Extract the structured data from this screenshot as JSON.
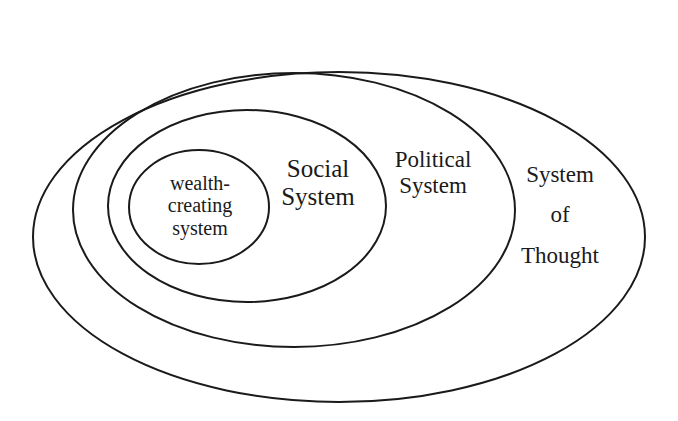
{
  "diagram": {
    "type": "nested-ellipses",
    "stroke_color": "#1a1a1a",
    "background": "#ffffff",
    "layers": [
      {
        "id": "system-of-thought",
        "lines": [
          "System",
          "of",
          "Thought"
        ]
      },
      {
        "id": "political-system",
        "lines": [
          "Political",
          "System"
        ]
      },
      {
        "id": "social-system",
        "lines": [
          "Social",
          "System"
        ]
      },
      {
        "id": "wealth-creating-system",
        "lines": [
          "wealth-",
          "creating",
          "system"
        ]
      }
    ]
  }
}
